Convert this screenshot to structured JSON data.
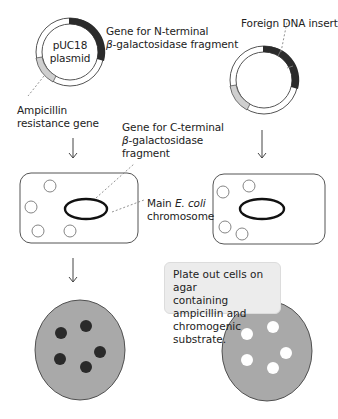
{
  "diagram": {
    "plasmid_left": {
      "label_line1": "pUC18",
      "label_line2": "plasmid"
    },
    "plasmid_right": {
      "insert_label": "Foreign DNA insert"
    },
    "labels": {
      "n_terminal_line1": "Gene for N-terminal",
      "n_terminal_beta": "β",
      "n_terminal_line2": "-galactosidase fragment",
      "ampicillin_line1": "Ampicillin",
      "ampicillin_line2": "resistance gene",
      "c_terminal_line1": "Gene for C-terminal",
      "c_terminal_beta": "β",
      "c_terminal_line2": "-galactosidase",
      "c_terminal_line3": "fragment",
      "chromosome_prefix": "Main ",
      "chromosome_italic": "E. coli",
      "chromosome_line2": "chromosome"
    },
    "callout": {
      "line1": "Plate out cells on agar",
      "line2": "containing ampicillin and",
      "line3": "chromogenic substrate."
    },
    "plates": {
      "left": {
        "colony_color": "#2a2a2a",
        "colony_count": 5,
        "description": "blue colonies (no insert)"
      },
      "right": {
        "colony_color": "#ffffff",
        "colony_count": 5,
        "description": "white colonies (insert)"
      }
    },
    "colors": {
      "plate_fill": "#a9a9a9",
      "gene_dark": "#2b2b2b",
      "gene_light": "#cfcfcf",
      "outline": "#555555",
      "callout_bg": "#ececec"
    }
  }
}
